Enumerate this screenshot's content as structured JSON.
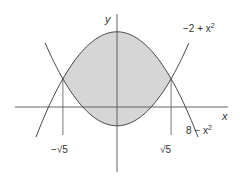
{
  "diagram": {
    "type": "region-between-curves",
    "axes": {
      "x_label": "x",
      "y_label": "y"
    },
    "curves": [
      {
        "name": "upper-parabola",
        "label": "8 − x²",
        "equation": "y = 8 - x^2"
      },
      {
        "name": "lower-parabola",
        "label": "−2 + x²",
        "equation": "y = -2 + x^2"
      }
    ],
    "intersections": [
      {
        "label": "−√5",
        "x": -2.236,
        "y": 3
      },
      {
        "label": "√5",
        "x": 2.236,
        "y": 3
      }
    ],
    "shaded_region": "between y = -2 + x^2 and y = 8 - x^2 for -√5 ≤ x ≤ √5",
    "colors": {
      "shade": "#d6d6d6",
      "stroke": "#444444",
      "text": "#333333"
    }
  },
  "labels": {
    "y_axis": "y",
    "x_axis": "x",
    "curve_top_label_prefix": "−2 + x",
    "curve_top_label_exp": "2",
    "curve_bottom_label_prefix": "8 − x",
    "curve_bottom_label_exp": "2",
    "neg_root": "−√5",
    "pos_root": "√5"
  }
}
